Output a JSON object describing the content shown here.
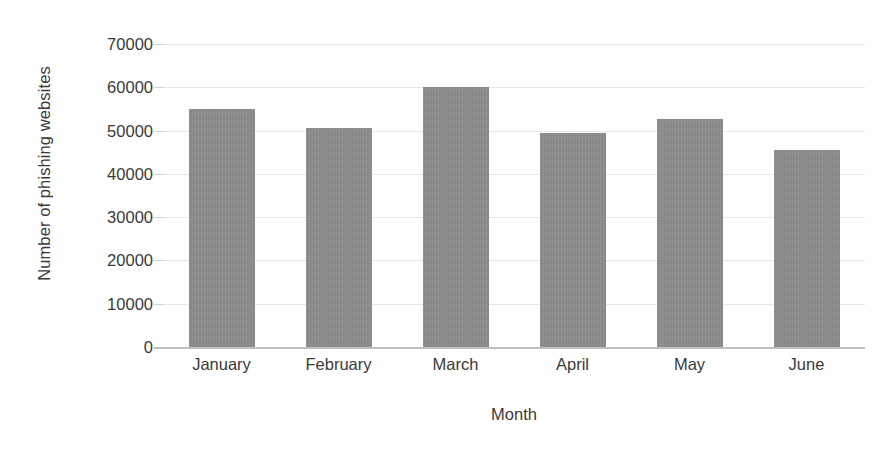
{
  "chart_data": {
    "type": "bar",
    "title": "",
    "subtitle": "",
    "categories": [
      "January",
      "February",
      "March",
      "April",
      "May",
      "June"
    ],
    "values": [
      55000,
      50500,
      60000,
      49500,
      52700,
      45500
    ],
    "xlabel": "Month",
    "ylabel": "Number of phishing websites",
    "ylim": [
      0,
      70000
    ],
    "ytick_values": [
      0,
      10000,
      20000,
      30000,
      40000,
      50000,
      60000,
      70000
    ],
    "ytick_labels": [
      "0",
      "10000",
      "20000",
      "30000",
      "40000",
      "50000",
      "60000",
      "70000"
    ],
    "grid": true,
    "legend": false,
    "legend_position": "none",
    "bar_color": "#8d8d8d",
    "gridline_color": "#e6e6e6",
    "axis_color": "#bfbfbf",
    "text_color": "#3a3a3a",
    "background_color": "#ffffff"
  }
}
